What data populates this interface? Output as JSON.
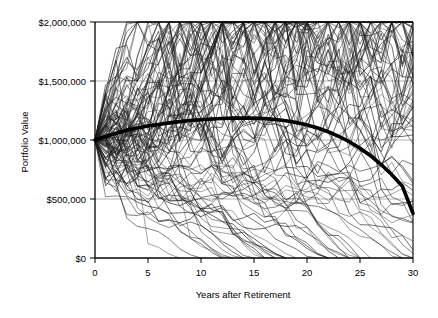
{
  "chart_data": {
    "type": "line",
    "title": "",
    "xlabel": "Years after Retirement",
    "ylabel": "Portfolio Value",
    "xlim": [
      0,
      30
    ],
    "ylim": [
      0,
      2000000
    ],
    "xticks": [
      0,
      5,
      10,
      15,
      20,
      25,
      30
    ],
    "xtick_labels": [
      "0",
      "5",
      "10",
      "15",
      "20",
      "25",
      "30"
    ],
    "yticks": [
      0,
      500000,
      1000000,
      1500000,
      2000000
    ],
    "ytick_labels": [
      "$0",
      "$500,000",
      "$1,000,000",
      "$1,500,000",
      "$2,000,000"
    ],
    "grid": "horizontal",
    "legend": "none",
    "starting_value": 1000000,
    "n_simulations": 100,
    "series": [
      {
        "name": "Mean path",
        "style": "thick",
        "x": [
          0,
          1,
          2,
          3,
          4,
          5,
          6,
          7,
          8,
          9,
          10,
          11,
          12,
          13,
          14,
          15,
          16,
          17,
          18,
          19,
          20,
          21,
          22,
          23,
          24,
          25,
          26,
          27,
          28,
          29,
          30
        ],
        "values": [
          1000000,
          1030000,
          1058000,
          1082000,
          1102000,
          1118000,
          1132000,
          1145000,
          1156000,
          1165000,
          1172000,
          1178000,
          1182000,
          1185000,
          1186000,
          1185000,
          1181000,
          1174000,
          1163000,
          1148000,
          1128000,
          1102000,
          1070000,
          1031000,
          985000,
          930000,
          866000,
          792000,
          706000,
          608000,
          378000
        ]
      }
    ],
    "colors": {
      "path_line": "#000000",
      "mean_line": "#000000",
      "gridline": "#b0b0b0",
      "axis": "#000000",
      "background": "#ffffff"
    }
  },
  "axes": {
    "y_title": "Portfolio Value",
    "x_title": "Years after Retirement",
    "y_labels": [
      "$2,000,000",
      "$1,500,000",
      "$1,000,000",
      "$500,000",
      "$0"
    ],
    "x_labels": [
      "0",
      "5",
      "10",
      "15",
      "20",
      "25",
      "30"
    ]
  }
}
